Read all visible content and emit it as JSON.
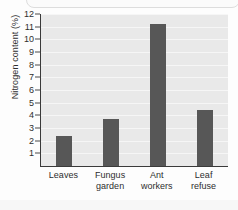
{
  "chart_data": {
    "type": "bar",
    "title": "",
    "xlabel": "",
    "ylabel": "Nitrogen content (%)",
    "categories": [
      "Leaves",
      "Fungus garden",
      "Ant workers",
      "Leaf refuse"
    ],
    "category_lines": [
      [
        "Leaves"
      ],
      [
        "Fungus",
        "garden"
      ],
      [
        "Ant",
        "workers"
      ],
      [
        "Leaf",
        "refuse"
      ]
    ],
    "values": [
      2.4,
      3.7,
      11.2,
      4.4
    ],
    "ylim": [
      0,
      12
    ],
    "ytick_labels": [
      "12",
      "11",
      "10",
      "9",
      "8",
      "7",
      "6",
      "5",
      "4",
      "3",
      "2",
      "1"
    ],
    "ytick_values": [
      12,
      11,
      10,
      9,
      8,
      7,
      6,
      5,
      4,
      3,
      2,
      1
    ],
    "grid": true,
    "legend": "none",
    "colors": {
      "bar": "#575757",
      "plot_background": "#e9e9e9",
      "gridline": "#f6f6f6",
      "axis": "#3a3a3a",
      "text": "#2e2e2e"
    }
  }
}
